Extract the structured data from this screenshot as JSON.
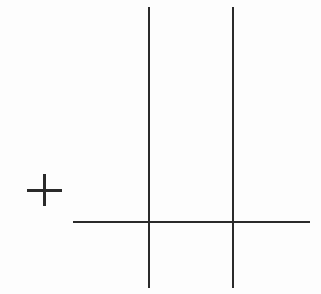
{
  "figure": {
    "background": "#fdfdfd",
    "stroke_color": "#2a2a2a",
    "plus_sign": {
      "symbol": "+",
      "center": [
        44,
        190
      ],
      "horizontal": {
        "x1": 27,
        "x2": 62,
        "y": 190,
        "thickness": 3
      },
      "vertical": {
        "x": 44,
        "y1": 174,
        "y2": 206,
        "thickness": 3
      }
    },
    "vertical_lines": [
      {
        "x": 149,
        "y1": 7,
        "y2": 288,
        "thickness": 2
      },
      {
        "x": 233,
        "y1": 7,
        "y2": 288,
        "thickness": 2
      }
    ],
    "horizontal_lines": [
      {
        "y": 222,
        "x1": 73,
        "x2": 310,
        "thickness": 2
      }
    ]
  }
}
